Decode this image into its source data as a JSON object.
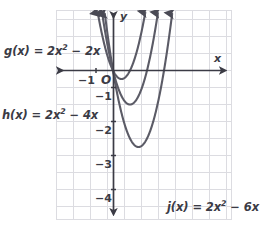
{
  "chart_data": {
    "type": "line",
    "title": "",
    "xlabel": "x",
    "ylabel": "y",
    "grid": true,
    "legend_position": "inline-annotations",
    "xlim": [
      -3.3,
      7.0
    ],
    "ylim": [
      -6.2,
      3.5
    ],
    "x_ticks": [
      -1
    ],
    "x_tick_labels": [
      "−1"
    ],
    "y_ticks": [
      -1,
      -2,
      -3,
      -4
    ],
    "y_tick_labels": [
      "−1",
      "−2",
      "−3",
      "−4"
    ],
    "origin_label": "O",
    "grid_step": 1,
    "series": [
      {
        "name": "g",
        "label": "g(x) = 2x² − 2x",
        "equation": "2x^2 - 2x",
        "a": 2,
        "b": -2,
        "c": 0,
        "vertex": [
          0.5,
          -0.5
        ],
        "roots": [
          0,
          1
        ],
        "color": "#5b5b66"
      },
      {
        "name": "h",
        "label": "h(x) = 2x² − 4x",
        "equation": "2x^2 - 4x",
        "a": 2,
        "b": -4,
        "c": 0,
        "vertex": [
          1,
          -2
        ],
        "roots": [
          0,
          2
        ],
        "color": "#5b5b66"
      },
      {
        "name": "j",
        "label": "j(x) = 2x² − 6x",
        "equation": "2x^2 - 6x",
        "a": 2,
        "b": -6,
        "c": 0,
        "vertex": [
          1.5,
          -4.5
        ],
        "roots": [
          0,
          3
        ],
        "color": "#5b5b66"
      }
    ]
  },
  "labels": {
    "g": "g(x) = 2x",
    "g_exp": "2",
    "g_tail": " − 2x",
    "h": "h(x) = 2x",
    "h_exp": "2",
    "h_tail": " − 4x",
    "j": "j(x) = 2x",
    "j_exp": "2",
    "j_tail": " − 6x",
    "axis_x": "x",
    "axis_y": "y",
    "origin": "O",
    "tick_neg1_x": "−1",
    "tick_y1": "−1",
    "tick_y2": "−2",
    "tick_y3": "−3",
    "tick_y4": "−4"
  },
  "colors": {
    "curve": "#5b5b66",
    "axis": "#3b3b45",
    "grid": "#dcdce1",
    "grid_major": "#d2d2d8",
    "text": "#3b3b45",
    "background": "#ffffff"
  }
}
